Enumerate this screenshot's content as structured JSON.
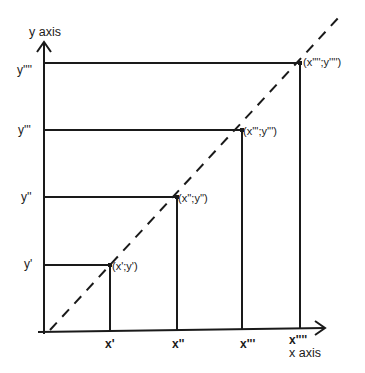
{
  "diagram": {
    "y_axis_label": "y axis",
    "x_axis_label": "x axis",
    "y_ticks": [
      {
        "label": "y''''",
        "y": 63
      },
      {
        "label": "y'''",
        "y": 130
      },
      {
        "label": "y''",
        "y": 197
      },
      {
        "label": "y'",
        "y": 265
      }
    ],
    "x_ticks": [
      {
        "label": "x'",
        "x": 110
      },
      {
        "label": "x''",
        "x": 177
      },
      {
        "label": "x'''",
        "x": 242
      },
      {
        "label": "x''''",
        "x": 300
      }
    ],
    "points": [
      {
        "label": "(x';y')"
      },
      {
        "label": "(x'';y'')"
      },
      {
        "label": "(x''';y''')"
      },
      {
        "label": "(x'''';y'''')"
      }
    ],
    "line_style": "dashed diagonal",
    "stroke_color": "#1a1a1a"
  }
}
